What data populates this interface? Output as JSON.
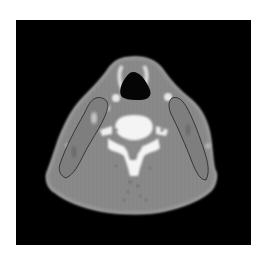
{
  "image": {
    "kind": "axial CT scan of neck",
    "background": "#ffffff",
    "frame_color": "#000000",
    "tissue_color": "#8a8a8a",
    "bone_color": "#f4f4f4",
    "airway_color": "#000000",
    "contour_color": "#2a2a2a"
  }
}
